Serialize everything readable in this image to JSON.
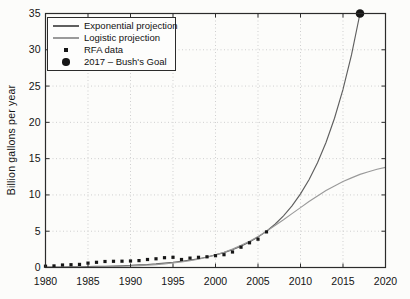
{
  "figure": {
    "background": "#fcfcfa",
    "axis_color": "#2b2b2b",
    "grid_color": "#cfcfcf",
    "tick_label_color": "#141414"
  },
  "chart_data": {
    "type": "line",
    "title": "",
    "xlabel": "",
    "ylabel": "Billion gallons per year",
    "xlim": [
      1980,
      2020
    ],
    "ylim": [
      0,
      35
    ],
    "xticks": [
      1980,
      1985,
      1990,
      1995,
      2000,
      2005,
      2010,
      2015,
      2020
    ],
    "yticks": [
      0,
      5,
      10,
      15,
      20,
      25,
      30,
      35
    ],
    "grid": true,
    "legend_position": "top-left",
    "series": [
      {
        "name": "Exponential projection",
        "kind": "line",
        "color": "#5f5f5f",
        "x": [
          1980,
          1981,
          1982,
          1983,
          1984,
          1985,
          1986,
          1987,
          1988,
          1989,
          1990,
          1991,
          1992,
          1993,
          1994,
          1995,
          1996,
          1997,
          1998,
          1999,
          2000,
          2001,
          2002,
          2003,
          2004,
          2005,
          2006,
          2007,
          2008,
          2009,
          2010,
          2011,
          2012,
          2013,
          2014,
          2015,
          2016,
          2017
        ],
        "y": [
          0.05,
          0.06,
          0.072,
          0.086,
          0.102,
          0.122,
          0.145,
          0.174,
          0.207,
          0.247,
          0.295,
          0.352,
          0.42,
          0.5,
          0.6,
          0.71,
          0.85,
          1.02,
          1.21,
          1.45,
          1.73,
          2.06,
          2.46,
          2.94,
          3.51,
          4.19,
          5.0,
          5.96,
          7.12,
          8.49,
          10.14,
          12.1,
          14.44,
          17.23,
          20.57,
          24.54,
          29.29,
          35.0
        ]
      },
      {
        "name": "Logistic projection",
        "kind": "line",
        "color": "#9a9a9a",
        "x": [
          1980,
          1981,
          1982,
          1983,
          1984,
          1985,
          1986,
          1987,
          1988,
          1989,
          1990,
          1991,
          1992,
          1993,
          1994,
          1995,
          1996,
          1997,
          1998,
          1999,
          2000,
          2001,
          2002,
          2003,
          2004,
          2005,
          2006,
          2007,
          2008,
          2009,
          2010,
          2011,
          2012,
          2013,
          2014,
          2015,
          2016,
          2017,
          2018,
          2019,
          2020
        ],
        "y": [
          0.02,
          0.03,
          0.035,
          0.043,
          0.054,
          0.068,
          0.085,
          0.106,
          0.13,
          0.165,
          0.21,
          0.26,
          0.32,
          0.4,
          0.5,
          0.62,
          0.76,
          0.94,
          1.15,
          1.42,
          1.73,
          2.11,
          2.54,
          3.06,
          3.63,
          4.29,
          5.0,
          5.79,
          6.58,
          7.43,
          8.25,
          9.09,
          9.84,
          10.6,
          11.24,
          11.85,
          12.35,
          12.83,
          13.19,
          13.54,
          13.79
        ]
      },
      {
        "name": "RFA data",
        "kind": "scatter",
        "marker": "square",
        "color": "#161616",
        "x": [
          1980,
          1981,
          1982,
          1983,
          1984,
          1985,
          1986,
          1987,
          1988,
          1989,
          1990,
          1991,
          1992,
          1993,
          1994,
          1995,
          1996,
          1997,
          1998,
          1999,
          2000,
          2001,
          2002,
          2003,
          2004,
          2005,
          2006
        ],
        "y": [
          0.18,
          0.22,
          0.35,
          0.38,
          0.43,
          0.61,
          0.71,
          0.83,
          0.85,
          0.87,
          0.9,
          0.95,
          1.1,
          1.2,
          1.35,
          1.4,
          1.1,
          1.3,
          1.4,
          1.47,
          1.63,
          1.77,
          2.13,
          2.8,
          3.4,
          3.9,
          4.9
        ]
      },
      {
        "name": "2017 – Bush's Goal",
        "kind": "scatter",
        "marker": "circle",
        "color": "#161616",
        "x": [
          2017
        ],
        "y": [
          35
        ]
      }
    ]
  }
}
